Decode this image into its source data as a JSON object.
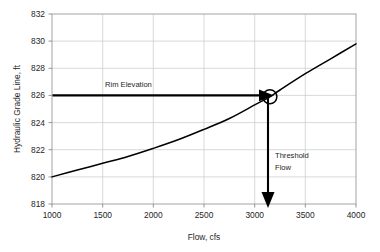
{
  "chart_data": {
    "type": "line",
    "title": "",
    "xlabel": "Flow, cfs",
    "ylabel": "Hydraulic Grade Line, ft",
    "xlim": [
      1000,
      4000
    ],
    "ylim": [
      818,
      832
    ],
    "xticks": [
      "1000",
      "1500",
      "2000",
      "2500",
      "3000",
      "3500",
      "4000"
    ],
    "xtick_values": [
      1000,
      1500,
      2000,
      2500,
      3000,
      3500,
      4000
    ],
    "yticks": [
      "818",
      "820",
      "822",
      "824",
      "826",
      "828",
      "830",
      "832"
    ],
    "ytick_values": [
      818,
      820,
      822,
      824,
      826,
      828,
      830,
      832
    ],
    "grid": true,
    "legend": "none",
    "series": [
      {
        "name": "Hydraulic Grade Line",
        "x": [
          1000,
          1250,
          1500,
          1750,
          2000,
          2250,
          2500,
          2750,
          3000,
          3150,
          3250,
          3500,
          3750,
          4000
        ],
        "values": [
          820.0,
          820.5,
          821.0,
          821.5,
          822.1,
          822.75,
          823.5,
          824.3,
          825.3,
          825.9,
          826.4,
          827.6,
          828.7,
          829.8
        ]
      }
    ],
    "annotations": [
      {
        "id": "rim-elevation",
        "label": "Rim Elevation",
        "type": "horizontal-arrow",
        "y_value": 826,
        "x_start": 1000,
        "x_end": 3150,
        "label_x": 2000,
        "label_y": 826.6
      },
      {
        "id": "threshold-flow",
        "label_line1": "Threshold",
        "label_line2": "Flow",
        "type": "vertical-arrow",
        "x_value": 3150,
        "y_start": 826,
        "y_end": 817.6,
        "label_x": 3200,
        "label_y": 821.7
      }
    ],
    "markers": [
      {
        "id": "intersection-marker",
        "shape": "circle",
        "x": 3150,
        "y": 825.9
      }
    ],
    "colors": {
      "curve": "#000000",
      "grid": "#c9c9c9",
      "axis": "#9a9a9a",
      "annotation": "#000000",
      "background": "#ffffff",
      "text": "#262626"
    }
  }
}
